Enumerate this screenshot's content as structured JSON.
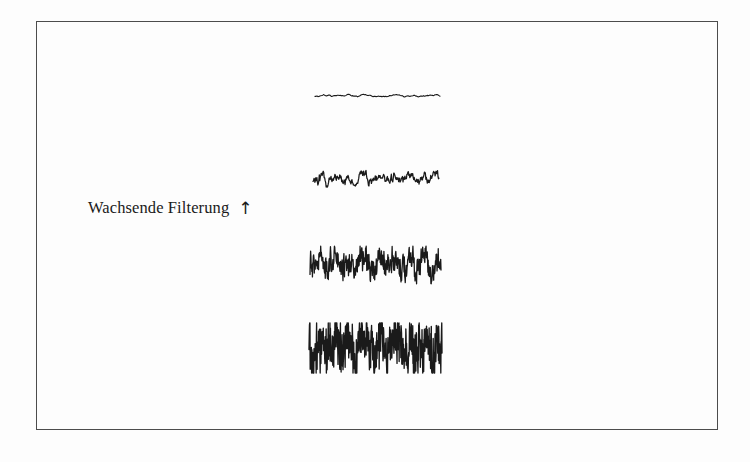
{
  "figure": {
    "label_text": "Wachsende Filterung",
    "arrow_glyph": "↑",
    "arrow_name": "up-arrow-icon",
    "border_color": "#4c4c4c",
    "trace_color": "#1a1a1a",
    "background_color": "#fdfdfd"
  },
  "chart_data": {
    "type": "line",
    "title": "",
    "subtitle": "",
    "xlabel": "",
    "ylabel": "Wachsende Filterung",
    "annotations": [
      "Wachsende Filterung ↑"
    ],
    "legend": [],
    "grid": false,
    "axes_visible": false,
    "frame": {
      "x": 36,
      "y": 21,
      "width": 682,
      "height": 409
    },
    "x_range": [
      0,
      1
    ],
    "series": [
      {
        "name": "trace-1-most-filtered",
        "order": 1,
        "center_y": 96,
        "x_start": 315,
        "x_end": 440,
        "amplitude": 4.0,
        "stroke_width": 1.1,
        "samples": 130,
        "roughness": 0.18,
        "seed": 17,
        "values": [
          0.12,
          -0.25,
          0.34,
          0.1,
          -0.3,
          0.42,
          0.21,
          -0.14,
          0.36,
          0.05,
          -0.38,
          0.28,
          0.44,
          0.16,
          -0.22,
          0.39,
          0.08,
          -0.31,
          0.25,
          0.47,
          0.13,
          -0.19,
          0.33,
          0.02,
          -0.41,
          0.3,
          0.18,
          -0.27,
          0.4,
          0.09
        ]
      },
      {
        "name": "trace-2",
        "order": 2,
        "center_y": 180,
        "x_start": 313,
        "x_end": 439,
        "amplitude": 9.0,
        "stroke_width": 1.25,
        "samples": 260,
        "roughness": 0.45,
        "seed": 41,
        "values": [
          0.35,
          -0.62,
          0.78,
          0.2,
          -0.55,
          0.88,
          0.41,
          -0.7,
          0.66,
          0.14,
          -0.82,
          0.59,
          0.91,
          0.3,
          -0.48,
          0.74,
          0.18,
          -0.66,
          0.52,
          0.95,
          0.27,
          -0.39,
          0.69,
          0.06,
          -0.85,
          0.63,
          0.37,
          -0.58,
          0.8,
          0.22
        ]
      },
      {
        "name": "trace-3",
        "order": 3,
        "center_y": 265,
        "x_start": 310,
        "x_end": 441,
        "amplitude": 15.0,
        "stroke_width": 1.3,
        "samples": 430,
        "roughness": 0.72,
        "seed": 73,
        "values": [
          0.6,
          -0.88,
          0.95,
          0.42,
          -0.77,
          0.99,
          0.68,
          -0.91,
          0.84,
          0.33,
          -0.96,
          0.79,
          0.98,
          0.51,
          -0.7,
          0.92,
          0.37,
          -0.85,
          0.75,
          1.0,
          0.46,
          -0.6,
          0.89,
          0.24,
          -0.98,
          0.81,
          0.57,
          -0.8,
          0.94,
          0.4
        ]
      },
      {
        "name": "trace-4-unfiltered",
        "order": 4,
        "center_y": 348,
        "x_start": 309,
        "x_end": 442,
        "amplitude": 20.0,
        "stroke_width": 1.35,
        "samples": 560,
        "roughness": 0.95,
        "seed": 109,
        "values": [
          0.72,
          -0.97,
          1.0,
          0.55,
          -0.9,
          1.0,
          0.8,
          -0.99,
          0.93,
          0.45,
          -1.0,
          0.88,
          1.0,
          0.64,
          -0.83,
          0.97,
          0.5,
          -0.94,
          0.86,
          1.0,
          0.58,
          -0.74,
          0.96,
          0.36,
          -1.0,
          0.9,
          0.7,
          -0.92,
          0.99,
          0.53
        ]
      }
    ]
  }
}
